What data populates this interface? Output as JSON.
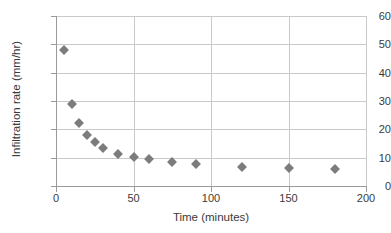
{
  "chart_data": {
    "type": "scatter",
    "title": "",
    "xlabel": "Time (minutes)",
    "ylabel": "Infiltration rate (mm/hr)",
    "xlim": [
      0,
      200
    ],
    "ylim": [
      0,
      60
    ],
    "xticks": [
      0,
      50,
      100,
      150,
      200
    ],
    "yticks": [
      0,
      10,
      20,
      30,
      40,
      50,
      60
    ],
    "grid": true,
    "legend": false,
    "marker": "diamond",
    "marker_color": "#7c7c7c",
    "x": [
      5,
      10,
      15,
      20,
      25,
      30,
      40,
      50,
      60,
      75,
      90,
      120,
      150,
      180
    ],
    "y": [
      48.0,
      28.8,
      22.4,
      18.0,
      15.5,
      13.5,
      11.3,
      10.1,
      9.4,
      8.5,
      7.8,
      6.7,
      6.4,
      6.1
    ],
    "points": [
      {
        "x": 5,
        "y": 48.0
      },
      {
        "x": 10,
        "y": 28.8
      },
      {
        "x": 15,
        "y": 22.4
      },
      {
        "x": 20,
        "y": 18.0
      },
      {
        "x": 25,
        "y": 15.5
      },
      {
        "x": 30,
        "y": 13.5
      },
      {
        "x": 40,
        "y": 11.3
      },
      {
        "x": 50,
        "y": 10.1
      },
      {
        "x": 60,
        "y": 9.4
      },
      {
        "x": 75,
        "y": 8.5
      },
      {
        "x": 90,
        "y": 7.8
      },
      {
        "x": 120,
        "y": 6.7
      },
      {
        "x": 150,
        "y": 6.4
      },
      {
        "x": 180,
        "y": 6.1
      }
    ]
  },
  "axes": {
    "x_tick_labels": [
      "0",
      "50",
      "100",
      "150",
      "200"
    ],
    "y_tick_labels": [
      "0",
      "10",
      "20",
      "30",
      "40",
      "50",
      "60"
    ],
    "x_title": "Time (minutes)",
    "y_title": "Infiltration rate (mm/hr)"
  },
  "colors": {
    "marker": "#7c7c7c",
    "grid": "#c9c9c9",
    "axis": "#9a9a9a",
    "text": "#3a3a3a",
    "background": "#ffffff"
  }
}
